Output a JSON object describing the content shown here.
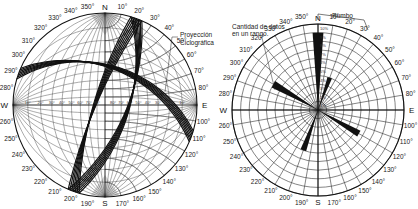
{
  "stereonet": {
    "cardinals": {
      "N": "N",
      "E": "E",
      "S": "S",
      "W": "W"
    },
    "azimuth_labels": [
      "10°",
      "20°",
      "30°",
      "40°",
      "50°",
      "60°",
      "70°",
      "80°",
      "100°",
      "110°",
      "120°",
      "130°",
      "140°",
      "150°",
      "160°",
      "170°",
      "190°",
      "200°",
      "210°",
      "220°",
      "230°",
      "240°",
      "250°",
      "260°",
      "280°",
      "290°",
      "300°",
      "310°",
      "320°",
      "330°",
      "340°",
      "350°"
    ],
    "dip_labels_west": [
      "10°",
      "20°",
      "30°",
      "40°",
      "50°",
      "60°",
      "70°",
      "80°"
    ],
    "dip_labels_east": [
      "80°",
      "70°",
      "60°",
      "50°",
      "40°",
      "30°",
      "20°",
      "10°"
    ],
    "annotation": "Proyección Ciclográfica",
    "great_circles": [
      {
        "name": "plane-a",
        "strike_deg": 20,
        "dip_deg": 62
      },
      {
        "name": "plane-b",
        "strike_deg": 290,
        "dip_deg": 45
      },
      {
        "name": "plane-c",
        "strike_deg": 200,
        "dip_deg": 78
      }
    ]
  },
  "rose": {
    "cardinals": {
      "N": "N",
      "E": "E",
      "S": "S",
      "W": "W"
    },
    "azimuth_labels": [
      "10°",
      "20°",
      "30°",
      "40°",
      "50°",
      "60°",
      "70°",
      "80°",
      "100°",
      "110°",
      "120°",
      "130°",
      "140°",
      "150°",
      "160°",
      "170°",
      "190°",
      "200°",
      "210°",
      "220°",
      "230°",
      "240°",
      "250°",
      "260°",
      "280°",
      "290°",
      "300°",
      "310°",
      "320°",
      "330°",
      "340°",
      "350°"
    ],
    "percent_labels": [
      "10%",
      "9%",
      "8%",
      "7%",
      "6%",
      "5%",
      "4%",
      "3%",
      "2%",
      "1%"
    ],
    "annotation_count": "Cantidad de datos en un rango.",
    "annotation_strike": "Rumbo",
    "petals": [
      {
        "azimuth_deg": 0,
        "percent": 9
      },
      {
        "azimuth_deg": 20,
        "percent": 4
      },
      {
        "azimuth_deg": 120,
        "percent": 5.5
      },
      {
        "azimuth_deg": 200,
        "percent": 5
      },
      {
        "azimuth_deg": 300,
        "percent": 6
      }
    ]
  }
}
